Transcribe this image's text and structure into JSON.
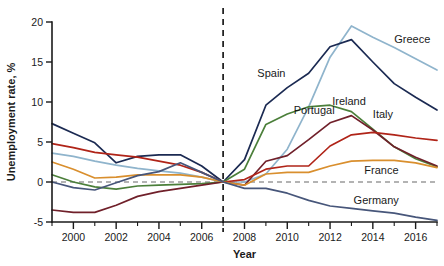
{
  "chart_data": {
    "type": "line",
    "title": "",
    "xlabel": "Year",
    "ylabel": "Unemployment rate, %",
    "xlim": [
      1999,
      2017
    ],
    "ylim": [
      -5,
      20
    ],
    "grid": false,
    "legend_position": "inline-labels",
    "x_ticks_major": [
      2000,
      2002,
      2004,
      2006,
      2008,
      2010,
      2012,
      2014,
      2016
    ],
    "x_ticks_minor": [
      1999,
      2001,
      2003,
      2005,
      2007,
      2009,
      2011,
      2013,
      2015,
      2017
    ],
    "y_ticks": [
      -5,
      0,
      5,
      10,
      15,
      20
    ],
    "x_tick_labels": [
      "2000",
      "2002",
      "2004",
      "2006",
      "2008",
      "2010",
      "2012",
      "2014",
      "2016"
    ],
    "y_tick_labels": [
      "-5",
      "0",
      "5",
      "10",
      "15",
      "20"
    ],
    "annotations": [
      {
        "name": "crisis-reference-line",
        "type": "vertical-dashed-line",
        "x": 2007,
        "label": ""
      },
      {
        "name": "zero-reference-line",
        "type": "horizontal-dashed-line",
        "y": 0,
        "label": ""
      }
    ],
    "x": [
      1999,
      2000,
      2001,
      2002,
      2003,
      2004,
      2005,
      2006,
      2007,
      2008,
      2009,
      2010,
      2011,
      2012,
      2013,
      2014,
      2015,
      2016,
      2017
    ],
    "series": [
      {
        "name": "Greece",
        "color": "#8fb4cc",
        "label_x": 2015.0,
        "label_y": 17.4,
        "values": [
          3.6,
          3.2,
          2.6,
          2.1,
          1.7,
          1.4,
          1.1,
          0.6,
          0.0,
          0.0,
          1.0,
          4.1,
          9.4,
          15.6,
          19.5,
          18.1,
          16.8,
          15.4,
          14.0
        ]
      },
      {
        "name": "Spain",
        "color": "#1b2a52",
        "label_x": 2008.6,
        "label_y": 13.1,
        "values": [
          7.3,
          6.1,
          4.9,
          2.4,
          3.2,
          3.4,
          3.4,
          2.0,
          0.0,
          2.8,
          9.6,
          11.8,
          13.6,
          16.9,
          17.8,
          15.0,
          12.3,
          10.6,
          9.0
        ]
      },
      {
        "name": "Ireland",
        "color": "#4b7f3a",
        "label_x": 2012.1,
        "label_y": 9.6,
        "values": [
          0.9,
          0.0,
          -0.6,
          -0.9,
          -0.5,
          -0.4,
          -0.3,
          -0.2,
          0.0,
          1.6,
          7.2,
          8.5,
          9.4,
          9.6,
          8.8,
          6.6,
          4.4,
          2.9,
          1.9
        ]
      },
      {
        "name": "Portugal",
        "color": "#70202a",
        "label_x": 2010.3,
        "label_y": 8.5,
        "values": [
          -3.5,
          -3.8,
          -3.8,
          -2.9,
          -1.8,
          -1.2,
          -0.8,
          -0.4,
          0.0,
          -0.4,
          2.6,
          3.3,
          5.3,
          7.4,
          8.3,
          6.5,
          4.4,
          3.1,
          2.0
        ]
      },
      {
        "name": "Italy",
        "color": "#b02418",
        "label_x": 2014.0,
        "label_y": 8.0,
        "values": [
          4.8,
          4.3,
          3.7,
          3.4,
          3.1,
          2.6,
          2.1,
          1.2,
          0.0,
          0.3,
          1.6,
          2.0,
          2.0,
          4.5,
          5.9,
          6.2,
          5.9,
          5.5,
          5.2
        ]
      },
      {
        "name": "France",
        "color": "#d98f2e",
        "label_x": 2013.6,
        "label_y": 1.0,
        "values": [
          2.5,
          1.6,
          0.5,
          0.6,
          0.9,
          0.9,
          0.9,
          0.6,
          0.0,
          -0.4,
          1.0,
          1.2,
          1.2,
          2.0,
          2.6,
          2.7,
          2.7,
          2.4,
          1.8
        ]
      },
      {
        "name": "Germany",
        "color": "#47567a",
        "label_x": 2013.1,
        "label_y": -2.7,
        "values": [
          0.0,
          -0.7,
          -1.0,
          -0.1,
          0.8,
          1.3,
          2.4,
          1.2,
          0.0,
          -0.8,
          -0.8,
          -1.4,
          -2.3,
          -3.0,
          -3.3,
          -3.6,
          -3.9,
          -4.4,
          -4.8
        ]
      }
    ]
  }
}
